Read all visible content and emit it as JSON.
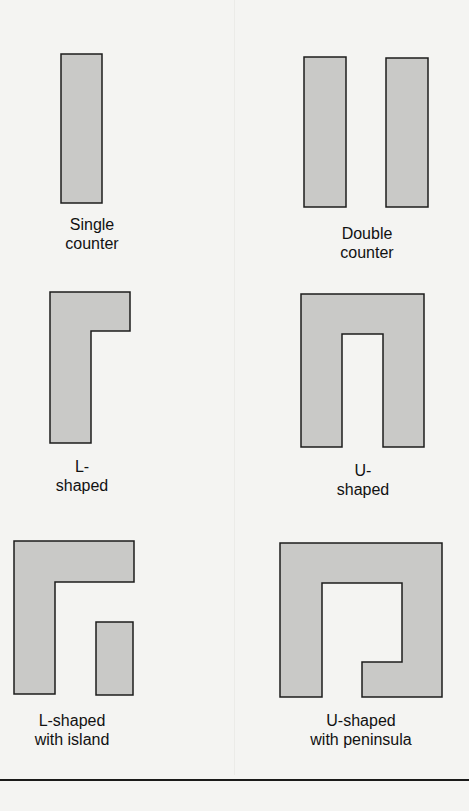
{
  "figure": {
    "layouts": [
      {
        "id": "single-counter",
        "label": "Single\ncounter"
      },
      {
        "id": "double-counter",
        "label": "Double\ncounter"
      },
      {
        "id": "l-shaped",
        "label": "L-\nshaped"
      },
      {
        "id": "u-shaped",
        "label": "U-\nshaped"
      },
      {
        "id": "l-shaped-with-island",
        "label": "L-shaped\nwith island"
      },
      {
        "id": "u-shaped-with-peninsula",
        "label": "U-shaped\nwith peninsula"
      }
    ],
    "colors": {
      "fill": "#c9c9c7",
      "stroke": "#1c1c1c",
      "background": "#f4f4f2"
    }
  }
}
